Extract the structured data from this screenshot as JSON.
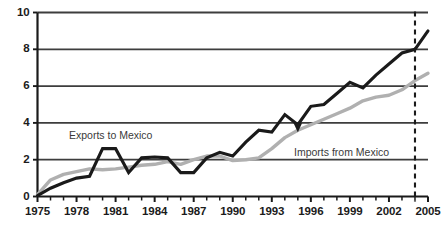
{
  "chart_data": {
    "type": "line",
    "title": "",
    "xlabel": "",
    "ylabel": "",
    "xlim": [
      1975,
      2005
    ],
    "ylim": [
      0,
      10
    ],
    "grid": true,
    "gridlines_y": [
      0,
      2,
      4,
      6,
      8,
      10
    ],
    "x_tick_labels": [
      "1975",
      "1978",
      "1981",
      "1984",
      "1987",
      "1990",
      "1993",
      "1996",
      "1999",
      "2002",
      "2005"
    ],
    "x_tick_values": [
      1975,
      1978,
      1981,
      1984,
      1987,
      1990,
      1993,
      1996,
      1999,
      2002,
      2005
    ],
    "x_minor_ticks_every": 1,
    "y_tick_labels": [
      "0",
      "2",
      "4",
      "6",
      "8",
      "10"
    ],
    "y_tick_values": [
      0,
      2,
      4,
      6,
      8,
      10
    ],
    "legend_position": "inline-annotations",
    "x": [
      1975,
      1976,
      1977,
      1978,
      1979,
      1980,
      1981,
      1982,
      1983,
      1984,
      1985,
      1986,
      1987,
      1988,
      1989,
      1990,
      1991,
      1992,
      1993,
      1994,
      1995,
      1996,
      1997,
      1998,
      1999,
      2000,
      2001,
      2002,
      2003,
      2004,
      2005
    ],
    "series": [
      {
        "name": "Exports to Mexico",
        "color": "#1a1a1a",
        "values": [
          0.05,
          0.45,
          0.75,
          1.0,
          1.1,
          2.6,
          2.6,
          1.3,
          2.1,
          2.15,
          2.1,
          1.3,
          1.3,
          2.1,
          2.4,
          2.2,
          2.95,
          3.6,
          3.5,
          4.45,
          3.9,
          4.9,
          5.0,
          5.6,
          6.2,
          5.9,
          6.6,
          7.2,
          7.8,
          8.0,
          9.0
        ]
      },
      {
        "name": "Imports from Mexico",
        "color": "#b0b0b0",
        "values": [
          0.1,
          0.9,
          1.2,
          1.35,
          1.5,
          1.45,
          1.5,
          1.6,
          1.7,
          1.75,
          1.9,
          1.75,
          2.0,
          2.2,
          2.2,
          1.95,
          2.0,
          2.1,
          2.6,
          3.2,
          3.6,
          3.9,
          4.2,
          4.5,
          4.8,
          5.2,
          5.4,
          5.5,
          5.8,
          6.3,
          6.7
        ]
      }
    ],
    "annotations": [
      {
        "name": "exports-label",
        "text": "Exports to Mexico",
        "x_px": 69,
        "y_px": 129
      },
      {
        "name": "imports-label",
        "text": "Imports from Mexico",
        "x_px": 294,
        "y_px": 146
      }
    ],
    "marker_arrow": {
      "name": "imports-pointer-arrow",
      "x_year": 1995,
      "y_value": 3.6
    },
    "reference_line": {
      "name": "projection-divider",
      "x_year": 2004,
      "style": "dashed",
      "color": "#1a1a1a"
    },
    "colors": {
      "axis": "#1a1a1a",
      "grid": "#3d3d3d",
      "exports": "#1a1a1a",
      "imports": "#b0b0b0",
      "background": "#ffffff",
      "annotation_text": "#3a3a3a"
    }
  }
}
